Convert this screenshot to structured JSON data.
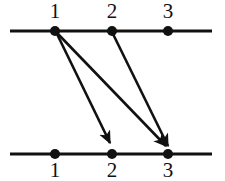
{
  "figure": {
    "type": "bipartite-graph-diagram",
    "background_color": "#ffffff",
    "ink_color": "#111111",
    "width": 225,
    "height": 181,
    "rows": [
      {
        "id": "top-row",
        "line": {
          "x1": 10,
          "x2": 212,
          "y": 31,
          "thickness": 3
        },
        "label_position": "above",
        "label_y": 18,
        "nodes": [
          {
            "id": "top-1",
            "label": "1",
            "x": 55,
            "y": 31,
            "radius": 5
          },
          {
            "id": "top-2",
            "label": "2",
            "x": 112,
            "y": 31,
            "radius": 5
          },
          {
            "id": "top-3",
            "label": "3",
            "x": 168,
            "y": 31,
            "radius": 5
          }
        ]
      },
      {
        "id": "bottom-row",
        "line": {
          "x1": 10,
          "x2": 212,
          "y": 154,
          "thickness": 3
        },
        "label_position": "below",
        "label_y": 177,
        "nodes": [
          {
            "id": "bottom-1",
            "label": "1",
            "x": 55,
            "y": 154,
            "radius": 5
          },
          {
            "id": "bottom-2",
            "label": "2",
            "x": 112,
            "y": 154,
            "radius": 5
          },
          {
            "id": "bottom-3",
            "label": "3",
            "x": 168,
            "y": 154,
            "radius": 5
          }
        ]
      }
    ],
    "edges": [
      {
        "id": "edge-1-to-2",
        "from": "top-1",
        "to": "bottom-2",
        "x1": 57,
        "y1": 34,
        "x2": 110,
        "y2": 143,
        "arrowhead": true
      },
      {
        "id": "edge-1-to-3",
        "from": "top-1",
        "to": "bottom-3",
        "x1": 58,
        "y1": 34,
        "x2": 166,
        "y2": 146,
        "arrowhead": true
      },
      {
        "id": "edge-2-to-3",
        "from": "top-2",
        "to": "bottom-3",
        "x1": 113,
        "y1": 34,
        "x2": 168,
        "y2": 146,
        "arrowhead": true
      }
    ]
  }
}
